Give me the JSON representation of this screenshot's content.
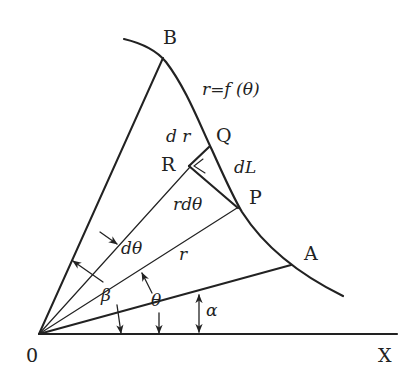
{
  "diagram": {
    "curve_equation": "r=f (θ)",
    "points": {
      "origin": "0",
      "x_axis": "X",
      "A": "A",
      "B": "B",
      "P": "P",
      "Q": "Q",
      "R": "R"
    },
    "labels": {
      "dr": "d r",
      "dL": "dL",
      "rdtheta": "rdθ",
      "dtheta": "dθ",
      "r": "r",
      "beta": "β",
      "theta": "θ",
      "alpha": "α"
    },
    "colors": {
      "ink": "#222222",
      "background": "#ffffff"
    }
  }
}
